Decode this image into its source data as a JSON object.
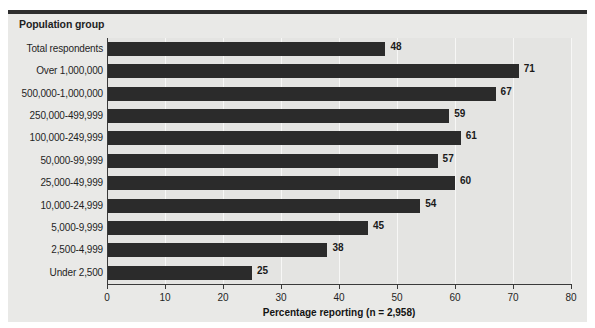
{
  "figure": {
    "panel_color": "#e9e9e7",
    "plot_color": "#e4e4e2",
    "bar_color": "#2b2b2b",
    "axis_color": "#3a3a3a",
    "gridline_color": "#f7f7f6",
    "group_header": "Population group"
  },
  "chart_data": {
    "type": "bar",
    "orientation": "horizontal",
    "title": "",
    "xlabel": "Percentage reporting (n = 2,958)",
    "ylabel": "Population group",
    "xlim": [
      0,
      80
    ],
    "xticks": [
      0,
      10,
      20,
      30,
      40,
      50,
      60,
      70,
      80
    ],
    "xtick_labels": [
      "0",
      "10",
      "20",
      "30",
      "40",
      "50",
      "60",
      "70",
      "80"
    ],
    "grid": true,
    "grid_axis": "x",
    "legend": false,
    "data_labels": true,
    "categories": [
      "Total respondents",
      "Over 1,000,000",
      "500,000-1,000,000",
      "250,000-499,999",
      "100,000-249,999",
      "50,000-99,999",
      "25,000-49,999",
      "10,000-24,999",
      "5,000-9,999",
      "2,500-4,999",
      "Under 2,500"
    ],
    "values": [
      48,
      71,
      67,
      59,
      61,
      57,
      60,
      54,
      45,
      38,
      25
    ],
    "value_labels": [
      "48",
      "71",
      "67",
      "59",
      "61",
      "57",
      "60",
      "54",
      "45",
      "38",
      "25"
    ]
  }
}
